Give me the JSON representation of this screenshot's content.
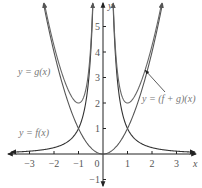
{
  "chart_data": {
    "type": "line",
    "title": "",
    "xlabel": "x",
    "ylabel": "y",
    "xlim": [
      -3.8,
      3.8
    ],
    "ylim": [
      -1.3,
      6.0
    ],
    "grid": false,
    "x_ticks": [
      -3,
      -2,
      -1,
      0,
      1,
      2,
      3
    ],
    "y_ticks": [
      -1,
      1,
      2,
      3,
      4,
      5
    ],
    "x_tick_labels": [
      "−3",
      "−2",
      "−1",
      "0",
      "1",
      "2",
      "3"
    ],
    "y_tick_labels": [
      "−1",
      "1",
      "2",
      "3",
      "4",
      "5"
    ],
    "series": [
      {
        "name": "y = f(x)",
        "formula": "1/x^2",
        "color": "#333333"
      },
      {
        "name": "y = g(x)",
        "formula": "x^2",
        "color": "#555555"
      },
      {
        "name": "y = (f + g)(x)",
        "formula": "x^2 + 1/x^2",
        "color": "#666666",
        "min_points": [
          [
            -1,
            2
          ],
          [
            1,
            2
          ]
        ]
      }
    ],
    "annotations": [
      {
        "text": "y = g(x)",
        "position": "left-upper"
      },
      {
        "text": "y = f(x)",
        "position": "left-lower"
      },
      {
        "text": "y = (f + g)(x)",
        "position": "right",
        "arrow_to": [
          1.35,
          2.4
        ]
      }
    ],
    "intersections": [
      [
        -1,
        1
      ],
      [
        1,
        1
      ]
    ]
  },
  "labels": {
    "g": "y = g(x)",
    "f": "y = f(x)",
    "fg": "y = (f + g)(x)",
    "x_axis": "x",
    "y_axis": "y"
  },
  "ticks": {
    "x": [
      {
        "value": -3,
        "label": "−3"
      },
      {
        "value": -2,
        "label": "−2"
      },
      {
        "value": -1,
        "label": "−1"
      },
      {
        "value": 1,
        "label": "1"
      },
      {
        "value": 2,
        "label": "2"
      },
      {
        "value": 3,
        "label": "3"
      }
    ],
    "origin_label": "0",
    "y": [
      {
        "value": 1,
        "label": "1"
      },
      {
        "value": 2,
        "label": "2"
      },
      {
        "value": 3,
        "label": "3"
      },
      {
        "value": 4,
        "label": "4"
      },
      {
        "value": 5,
        "label": "5"
      },
      {
        "value": -1,
        "label": "−1"
      }
    ]
  },
  "colors": {
    "axis": "#222222",
    "curve": "#555555",
    "curve_dark": "#333333",
    "text": "#666666"
  }
}
